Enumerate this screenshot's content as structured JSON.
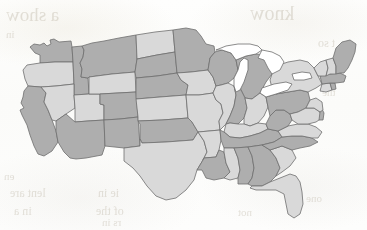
{
  "document": {
    "kind": "scanned-page",
    "background_color": "#fdfdfb",
    "ghost_text_color": "#a8a08c"
  },
  "map": {
    "title": "",
    "subject": "Contiguous United States",
    "outline_color": "#6f6f6f",
    "lake_color": "#ffffff",
    "shade_light": "#d9d9d9",
    "shade_dark": "#aeaeae",
    "legend": []
  },
  "ghost_marks": [
    {
      "text": "a show",
      "x": 6,
      "y": 4,
      "size": 19
    },
    {
      "text": "know",
      "x": 250,
      "y": 2,
      "size": 20
    },
    {
      "text": "in",
      "x": 6,
      "y": 28,
      "size": 11
    },
    {
      "text": "t so",
      "x": 318,
      "y": 36,
      "size": 12
    },
    {
      "text": "one",
      "x": 320,
      "y": 62,
      "size": 11
    },
    {
      "text": "the",
      "x": 322,
      "y": 86,
      "size": 11
    },
    {
      "text": "en",
      "x": 4,
      "y": 170,
      "size": 11
    },
    {
      "text": "lent are",
      "x": 10,
      "y": 186,
      "size": 12
    },
    {
      "text": "ie in",
      "x": 98,
      "y": 186,
      "size": 12
    },
    {
      "text": "in a",
      "x": 14,
      "y": 204,
      "size": 12
    },
    {
      "text": "of the",
      "x": 96,
      "y": 204,
      "size": 12
    },
    {
      "text": "rs in",
      "x": 102,
      "y": 216,
      "size": 11
    },
    {
      "text": "ter",
      "x": 236,
      "y": 174,
      "size": 11
    },
    {
      "text": "one",
      "x": 306,
      "y": 192,
      "size": 11
    },
    {
      "text": "not",
      "x": 238,
      "y": 206,
      "size": 11
    }
  ],
  "chart_data": {
    "type": "choropleth",
    "title": "",
    "region": "United States (contiguous 48)",
    "scale": {
      "kind": "categorical-two-tone",
      "categories": [
        {
          "name": "light",
          "color": "#d9d9d9"
        },
        {
          "name": "dark",
          "color": "#aeaeae"
        }
      ]
    },
    "features": [
      {
        "id": "WA",
        "name": "Washington",
        "category": "dark"
      },
      {
        "id": "OR",
        "name": "Oregon",
        "category": "light"
      },
      {
        "id": "CA",
        "name": "California",
        "category": "dark"
      },
      {
        "id": "ID",
        "name": "Idaho",
        "category": "dark"
      },
      {
        "id": "NV",
        "name": "Nevada",
        "category": "light"
      },
      {
        "id": "UT",
        "name": "Utah",
        "category": "light"
      },
      {
        "id": "AZ",
        "name": "Arizona",
        "category": "dark"
      },
      {
        "id": "MT",
        "name": "Montana",
        "category": "dark"
      },
      {
        "id": "WY",
        "name": "Wyoming",
        "category": "light"
      },
      {
        "id": "CO",
        "name": "Colorado",
        "category": "dark"
      },
      {
        "id": "NM",
        "name": "New Mexico",
        "category": "dark"
      },
      {
        "id": "ND",
        "name": "North Dakota",
        "category": "light"
      },
      {
        "id": "SD",
        "name": "South Dakota",
        "category": "dark"
      },
      {
        "id": "NE",
        "name": "Nebraska",
        "category": "dark"
      },
      {
        "id": "KS",
        "name": "Kansas",
        "category": "light"
      },
      {
        "id": "OK",
        "name": "Oklahoma",
        "category": "dark"
      },
      {
        "id": "TX",
        "name": "Texas",
        "category": "light"
      },
      {
        "id": "MN",
        "name": "Minnesota",
        "category": "dark"
      },
      {
        "id": "IA",
        "name": "Iowa",
        "category": "light"
      },
      {
        "id": "MO",
        "name": "Missouri",
        "category": "light"
      },
      {
        "id": "AR",
        "name": "Arkansas",
        "category": "light"
      },
      {
        "id": "LA",
        "name": "Louisiana",
        "category": "dark"
      },
      {
        "id": "WI",
        "name": "Wisconsin",
        "category": "dark"
      },
      {
        "id": "IL",
        "name": "Illinois",
        "category": "light"
      },
      {
        "id": "MI",
        "name": "Michigan",
        "category": "dark"
      },
      {
        "id": "IN",
        "name": "Indiana",
        "category": "dark"
      },
      {
        "id": "OH",
        "name": "Ohio",
        "category": "light"
      },
      {
        "id": "KY",
        "name": "Kentucky",
        "category": "light"
      },
      {
        "id": "TN",
        "name": "Tennessee",
        "category": "dark"
      },
      {
        "id": "MS",
        "name": "Mississippi",
        "category": "light"
      },
      {
        "id": "AL",
        "name": "Alabama",
        "category": "dark"
      },
      {
        "id": "GA",
        "name": "Georgia",
        "category": "dark"
      },
      {
        "id": "FL",
        "name": "Florida",
        "category": "light"
      },
      {
        "id": "SC",
        "name": "South Carolina",
        "category": "light"
      },
      {
        "id": "NC",
        "name": "North Carolina",
        "category": "dark"
      },
      {
        "id": "VA",
        "name": "Virginia",
        "category": "light"
      },
      {
        "id": "WV",
        "name": "West Virginia",
        "category": "dark"
      },
      {
        "id": "PA",
        "name": "Pennsylvania",
        "category": "dark"
      },
      {
        "id": "NY",
        "name": "New York",
        "category": "light"
      },
      {
        "id": "MD",
        "name": "Maryland",
        "category": "light"
      },
      {
        "id": "DE",
        "name": "Delaware",
        "category": "dark"
      },
      {
        "id": "NJ",
        "name": "New Jersey",
        "category": "light"
      },
      {
        "id": "CT",
        "name": "Connecticut",
        "category": "light"
      },
      {
        "id": "RI",
        "name": "Rhode Island",
        "category": "dark"
      },
      {
        "id": "MA",
        "name": "Massachusetts",
        "category": "dark"
      },
      {
        "id": "VT",
        "name": "Vermont",
        "category": "light"
      },
      {
        "id": "NH",
        "name": "New Hampshire",
        "category": "light"
      },
      {
        "id": "ME",
        "name": "Maine",
        "category": "dark"
      }
    ],
    "water_bodies": [
      {
        "id": "LAKE-SUPERIOR",
        "name": "Lake Superior"
      },
      {
        "id": "LAKE-MICHIGAN",
        "name": "Lake Michigan"
      },
      {
        "id": "LAKE-HURON",
        "name": "Lake Huron"
      },
      {
        "id": "LAKE-ERIE",
        "name": "Lake Erie"
      },
      {
        "id": "LAKE-ONTARIO",
        "name": "Lake Ontario"
      }
    ]
  }
}
